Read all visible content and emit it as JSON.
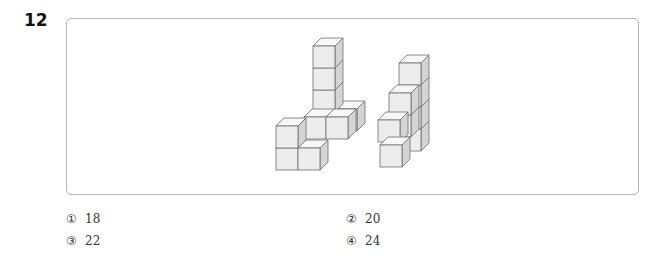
{
  "question": {
    "number": "12",
    "figure": {
      "description": "Two stacked-cube structures drawn in isometric view",
      "colors": {
        "front": "#ececec",
        "top": "#f7f7f7",
        "side": "#d4d4d4",
        "edge": "#6f6f6f",
        "border": "#b5b5b5"
      }
    },
    "options": [
      {
        "mark": "①",
        "value": "18"
      },
      {
        "mark": "②",
        "value": "20"
      },
      {
        "mark": "③",
        "value": "22"
      },
      {
        "mark": "④",
        "value": "24"
      }
    ]
  }
}
